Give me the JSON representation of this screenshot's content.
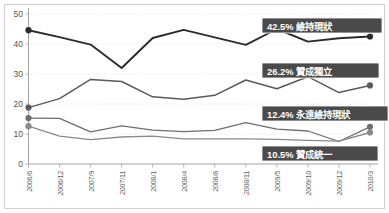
{
  "chart_data": {
    "type": "line",
    "title": "",
    "subtitle": "",
    "xlabel": "",
    "ylabel": "",
    "ylim": [
      0,
      50
    ],
    "yticks": [
      0,
      10,
      20,
      30,
      40,
      50
    ],
    "grid": true,
    "legend_position": "right-inline-callouts",
    "categories": [
      "2006/6",
      "2006/12",
      "2007/9",
      "2007/11",
      "2008/1",
      "2008/4",
      "2008/8",
      "2008/11",
      "2009/5",
      "2009/10",
      "2009/12",
      "2010/3"
    ],
    "series": [
      {
        "name": "維持現狀",
        "end_value": 42.5,
        "color": "#2b2b2b",
        "values": [
          44.6,
          42.3,
          39.8,
          32.0,
          42.0,
          44.7,
          42.2,
          39.7,
          45.0,
          40.8,
          41.9,
          42.5
        ]
      },
      {
        "name": "贊成獨立",
        "end_value": 26.2,
        "color": "#5a5a5a",
        "values": [
          18.8,
          21.8,
          28.2,
          27.5,
          22.4,
          21.6,
          22.9,
          28.0,
          25.1,
          29.1,
          23.8,
          26.2
        ]
      },
      {
        "name": "永遠維持現狀",
        "end_value": 12.4,
        "color": "#6e6e6e",
        "values": [
          15.3,
          15.2,
          10.7,
          12.7,
          11.3,
          10.8,
          11.2,
          13.8,
          11.6,
          11.0,
          7.5,
          12.4
        ]
      },
      {
        "name": "贊成統一",
        "end_value": 10.5,
        "color": "#8a8a8a",
        "values": [
          12.6,
          9.3,
          8.1,
          9.0,
          9.3,
          8.4,
          8.4,
          8.4,
          8.2,
          7.9,
          7.6,
          10.5
        ]
      }
    ],
    "callouts": [
      {
        "value_label": "42.5%",
        "name_label": "維持現狀",
        "full": "42.5% 維持現狀"
      },
      {
        "value_label": "26.2%",
        "name_label": "贊成獨立",
        "full": "26.2% 贊成獨立"
      },
      {
        "value_label": "12.4%",
        "name_label": "永遠維持現狀",
        "full": "12.4% 永遠維持現狀"
      },
      {
        "value_label": "10.5%",
        "name_label": "贊成統一",
        "full": "10.5% 贊成統一"
      }
    ],
    "callout_style": {
      "background": "#4a4a4a",
      "text_color": "#ffffff"
    }
  },
  "axis": {
    "y_labels": [
      "50",
      "40",
      "30",
      "20",
      "10",
      "0"
    ],
    "x_labels": [
      "2006/6",
      "2006/12",
      "2007/9",
      "2007/11",
      "2008/1",
      "2008/4",
      "2008/8",
      "2008/11",
      "2009/5",
      "2009/10",
      "2009/12",
      "2010/3"
    ]
  },
  "callouts": {
    "c0": "42.5% 維持現狀",
    "c1": "26.2% 贊成獨立",
    "c2": "12.4% 永遠維持現狀",
    "c3": "10.5% 贊成統一"
  }
}
